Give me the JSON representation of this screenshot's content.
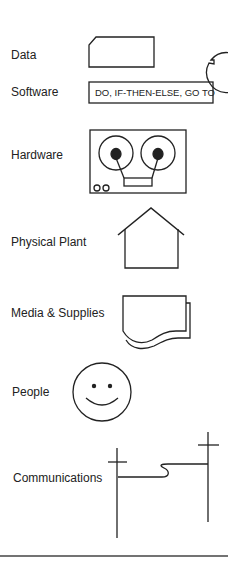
{
  "categories": [
    {
      "id": "data",
      "label": "Data",
      "icons": [
        "card-shape",
        "circle-with-tick"
      ]
    },
    {
      "id": "software",
      "label": "Software",
      "icon_text": "DO, IF-THEN-ELSE, GO TO"
    },
    {
      "id": "hardware",
      "label": "Hardware",
      "icons": [
        "tape-recorder"
      ]
    },
    {
      "id": "physical_plant",
      "label": "Physical Plant",
      "icons": [
        "house"
      ]
    },
    {
      "id": "media_supplies",
      "label": "Media & Supplies",
      "icons": [
        "document-stack"
      ]
    },
    {
      "id": "people",
      "label": "People",
      "icons": [
        "smiley-face"
      ]
    },
    {
      "id": "communications",
      "label": "Communications",
      "icons": [
        "telephone-poles"
      ]
    }
  ],
  "colors": {
    "stroke": "#222222",
    "background": "#ffffff"
  }
}
